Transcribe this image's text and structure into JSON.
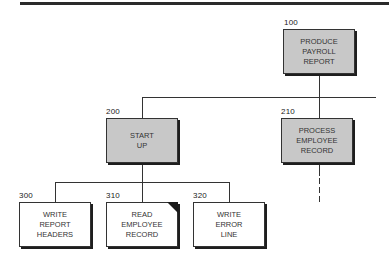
{
  "diagram": {
    "type": "structure-chart",
    "colors": {
      "module_fill_gray": "#c8c8c8",
      "module_fill_white": "#ffffff",
      "line": "#333333"
    },
    "modules": [
      {
        "id": "100",
        "lines": [
          "PRODUCE",
          "PAYROLL",
          "REPORT"
        ],
        "fill": "gray",
        "parent": null
      },
      {
        "id": "200",
        "lines": [
          "START",
          "UP"
        ],
        "fill": "gray",
        "parent": "100"
      },
      {
        "id": "210",
        "lines": [
          "PROCESS",
          "EMPLOYEE",
          "RECORD"
        ],
        "fill": "gray",
        "parent": "100"
      },
      {
        "id": "300",
        "lines": [
          "WRITE",
          "REPORT",
          "HEADERS"
        ],
        "fill": "white",
        "parent": "200"
      },
      {
        "id": "310",
        "lines": [
          "READ",
          "EMPLOYEE",
          "RECORD"
        ],
        "fill": "white",
        "parent": "200",
        "marker": "corner-triangle"
      },
      {
        "id": "320",
        "lines": [
          "WRITE",
          "ERROR",
          "LINE"
        ],
        "fill": "white",
        "parent": "200"
      }
    ],
    "continuations": [
      {
        "from": "210",
        "style": "dashed",
        "direction": "down"
      },
      {
        "from": "100",
        "style": "solid",
        "direction": "right"
      }
    ]
  }
}
